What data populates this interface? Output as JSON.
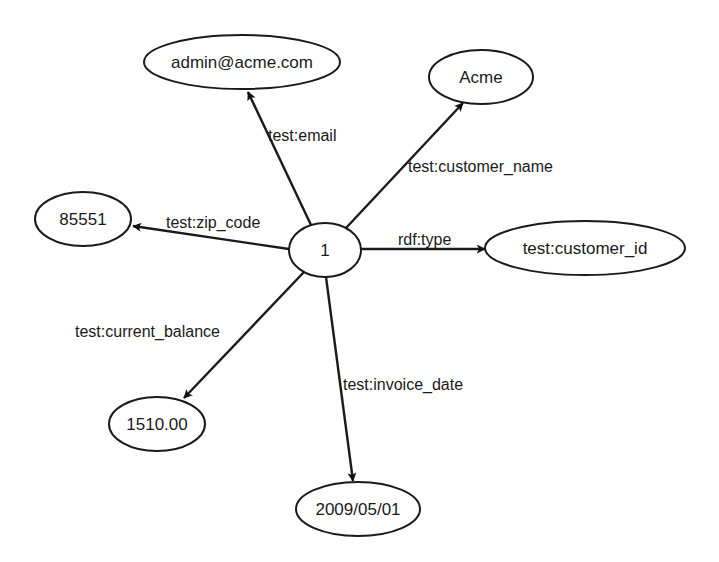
{
  "diagram": {
    "type": "rdf-graph",
    "center": {
      "label": "1",
      "cx": 325,
      "cy": 250,
      "rx": 36,
      "ry": 27
    },
    "nodes": [
      {
        "id": "email",
        "label": "admin@acme.com",
        "cx": 242,
        "cy": 62,
        "rx": 98,
        "ry": 27
      },
      {
        "id": "name",
        "label": "Acme",
        "cx": 481,
        "cy": 77,
        "rx": 52,
        "ry": 27
      },
      {
        "id": "zip",
        "label": "85551",
        "cx": 83,
        "cy": 219,
        "rx": 48,
        "ry": 27
      },
      {
        "id": "type",
        "label": "test:customer_id",
        "cx": 585,
        "cy": 248,
        "rx": 100,
        "ry": 27
      },
      {
        "id": "balance",
        "label": "1510.00",
        "cx": 157,
        "cy": 424,
        "rx": 48,
        "ry": 27
      },
      {
        "id": "invoice",
        "label": "2009/05/01",
        "cx": 358,
        "cy": 509,
        "rx": 62,
        "ry": 27
      }
    ],
    "edges": [
      {
        "to": "email",
        "label": "test:email",
        "x1": 311,
        "y1": 225,
        "x2": 248,
        "y2": 92,
        "lx": 268,
        "ly": 141
      },
      {
        "to": "name",
        "label": "test:customer_name",
        "x1": 346,
        "y1": 228,
        "x2": 463,
        "y2": 103,
        "lx": 408,
        "ly": 172
      },
      {
        "to": "zip",
        "label": "test:zip_code",
        "x1": 289,
        "y1": 249,
        "x2": 133,
        "y2": 226,
        "lx": 166,
        "ly": 228
      },
      {
        "to": "type",
        "label": "rdf:type",
        "x1": 361,
        "y1": 249,
        "x2": 485,
        "y2": 249,
        "lx": 398,
        "ly": 245
      },
      {
        "to": "balance",
        "label": "test:current_balance",
        "x1": 304,
        "y1": 272,
        "x2": 184,
        "y2": 398,
        "lx": 75,
        "ly": 337
      },
      {
        "to": "invoice",
        "label": "test:invoice_date",
        "x1": 326,
        "y1": 277,
        "x2": 353,
        "y2": 481,
        "lx": 343,
        "ly": 390
      }
    ],
    "colors": {
      "stroke": "#1a1a1a",
      "background": "#ffffff"
    }
  }
}
